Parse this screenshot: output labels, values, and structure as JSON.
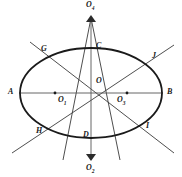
{
  "figure": {
    "stroke_color": "#2b2b2b",
    "background_color": "#ffffff",
    "ellipse": {
      "center": [
        91,
        93
      ],
      "rx": 71,
      "ry": 45
    },
    "labels": {
      "top_apex": "O",
      "top_apex_sub": "4",
      "bottom_apex": "O",
      "bottom_apex_sub": "2",
      "left_center": "O",
      "left_center_sub": "1",
      "right_center": "O",
      "right_center_sub": "3",
      "center": "O",
      "left_vertex": "A",
      "right_vertex": "B",
      "top_point": "C",
      "bottom_point": "D",
      "upper_left_end": "G",
      "lower_left_end": "H",
      "lower_right_end": "I",
      "upper_right_end": "J"
    },
    "lines": {
      "horizontal_axis": {
        "from": [
          20,
          93
        ],
        "to": [
          162,
          93
        ]
      },
      "vertical_axis": {
        "from": [
          91,
          17
        ],
        "to": [
          91,
          161
        ]
      },
      "diagonal_G_I": {
        "from": [
          30,
          43
        ],
        "to": [
          172,
          152
        ]
      },
      "diagonal_H_J": {
        "from": [
          12,
          152
        ],
        "to": [
          172,
          46
        ]
      },
      "ray_O4_left": {
        "from": [
          91,
          17
        ],
        "to": [
          64,
          161
        ]
      },
      "ray_O4_right": {
        "from": [
          91,
          17
        ],
        "to": [
          120,
          161
        ]
      }
    }
  }
}
